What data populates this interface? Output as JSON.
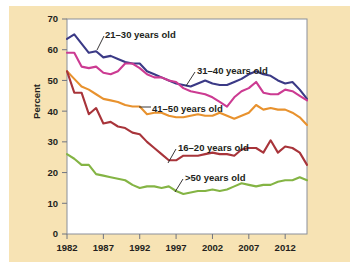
{
  "figure": {
    "background_color": "#f7e3b4",
    "panel_color": "#ffffff",
    "axis_color": "#231f20"
  },
  "axis": {
    "y_title": "Percent",
    "y_ticks": [
      "0",
      "10",
      "20",
      "30",
      "40",
      "50",
      "60",
      "70"
    ],
    "x_ticks": [
      "1982",
      "1987",
      "1992",
      "1997",
      "2002",
      "2007",
      "2012"
    ]
  },
  "annotations": [
    {
      "text": "21–30 years old",
      "x": 96,
      "y": 32
    },
    {
      "text": "31–40 years old",
      "x": 188,
      "y": 68
    },
    {
      "text": "41–50 years old",
      "x": 143,
      "y": 106
    },
    {
      "text": "16–20 years old",
      "x": 169,
      "y": 145
    },
    {
      "text": ">50 years old",
      "x": 176,
      "y": 175
    }
  ],
  "chart_data": {
    "type": "line",
    "title": "",
    "xlabel": "",
    "ylabel": "Percent",
    "xlim": [
      1982,
      2015
    ],
    "ylim": [
      0,
      70
    ],
    "grid": false,
    "legend": "inline-annotations",
    "x": [
      1982,
      1983,
      1984,
      1985,
      1986,
      1987,
      1988,
      1989,
      1990,
      1991,
      1992,
      1993,
      1994,
      1995,
      1996,
      1997,
      1998,
      1999,
      2000,
      2001,
      2002,
      2003,
      2004,
      2005,
      2006,
      2007,
      2008,
      2009,
      2010,
      2011,
      2012,
      2013,
      2014,
      2015
    ],
    "series": [
      {
        "name": "21–30 years old",
        "color": "#3b3a86",
        "values": [
          63.5,
          65.0,
          62.0,
          59.0,
          59.5,
          57.5,
          58.0,
          57.0,
          56.0,
          55.5,
          55.5,
          53.0,
          52.0,
          51.0,
          50.0,
          49.0,
          48.5,
          48.0,
          49.0,
          50.0,
          49.0,
          48.5,
          48.5,
          49.5,
          50.5,
          52.0,
          53.0,
          52.0,
          51.5,
          50.0,
          49.0,
          49.5,
          47.0,
          44.0
        ]
      },
      {
        "name": "31–40 years old",
        "color": "#cc3b92",
        "values": [
          59.0,
          59.0,
          54.5,
          54.0,
          54.5,
          52.5,
          52.0,
          53.0,
          55.5,
          55.5,
          54.0,
          52.0,
          51.0,
          51.0,
          50.0,
          49.5,
          47.5,
          46.5,
          46.0,
          45.5,
          44.5,
          43.0,
          41.5,
          44.5,
          46.5,
          47.5,
          49.5,
          46.0,
          45.5,
          45.5,
          47.0,
          46.5,
          45.0,
          43.5
        ]
      },
      {
        "name": "41–50 years old",
        "color": "#e8922e",
        "values": [
          53.0,
          50.5,
          48.0,
          47.0,
          45.5,
          44.0,
          43.5,
          43.0,
          42.0,
          41.5,
          41.5,
          39.0,
          39.5,
          39.5,
          38.5,
          38.0,
          38.0,
          38.5,
          39.0,
          38.5,
          38.5,
          39.5,
          38.5,
          37.5,
          38.5,
          39.5,
          42.0,
          40.5,
          41.0,
          40.5,
          40.5,
          39.5,
          38.0,
          35.5
        ]
      },
      {
        "name": "16–20 years old",
        "color": "#a8343a",
        "values": [
          53.0,
          46.0,
          46.0,
          39.0,
          41.0,
          36.0,
          36.5,
          35.0,
          34.5,
          33.0,
          32.5,
          30.0,
          28.0,
          26.0,
          24.0,
          24.0,
          25.5,
          25.5,
          25.5,
          26.0,
          26.5,
          26.0,
          26.0,
          25.5,
          27.5,
          28.0,
          28.0,
          26.5,
          30.5,
          26.5,
          28.5,
          28.0,
          26.5,
          22.5
        ]
      },
      {
        "name": ">50 years old",
        "color": "#84b444",
        "values": [
          26.0,
          24.5,
          22.5,
          22.5,
          19.5,
          19.0,
          18.5,
          18.0,
          17.5,
          16.0,
          15.0,
          15.5,
          15.5,
          15.0,
          15.5,
          14.0,
          13.0,
          13.5,
          14.0,
          14.0,
          14.5,
          14.0,
          14.5,
          15.5,
          16.5,
          16.0,
          15.5,
          16.0,
          16.0,
          17.0,
          17.5,
          17.5,
          18.5,
          17.5
        ]
      }
    ]
  }
}
